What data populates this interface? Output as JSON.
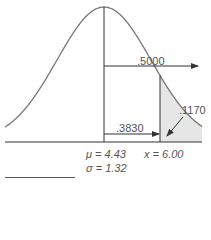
{
  "diagram": {
    "type": "normal-distribution",
    "mean_label": "μ = 4.43",
    "sd_label": "σ = 1.32",
    "x_label": "x = 6.00",
    "areas": {
      "right_half": ".5000",
      "between_mean_and_x": ".3830",
      "right_tail": ".1170"
    },
    "colors": {
      "curve": "#777777",
      "lines": "#333333",
      "tail_fill": "#e6e6e6",
      "text": "#555555"
    }
  },
  "chart_data": {
    "type": "area",
    "title": "",
    "distribution": "normal",
    "mean": 4.43,
    "sd": 1.32,
    "x_value": 6.0,
    "annotations": [
      {
        "label": ".5000",
        "meaning": "area to the right of the mean"
      },
      {
        "label": ".3830",
        "meaning": "area between mean and x = 6.00"
      },
      {
        "label": ".1170",
        "meaning": "shaded tail area to the right of x = 6.00"
      }
    ],
    "xlabel": "",
    "ylabel": "",
    "grid": false
  }
}
